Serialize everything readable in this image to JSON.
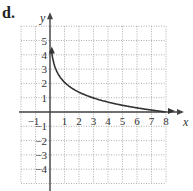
{
  "figure_label": "d.",
  "chart_data": {
    "type": "line",
    "title": "",
    "xlabel": "x",
    "ylabel": "y",
    "xlim": [
      -2,
      8
    ],
    "ylim": [
      -5,
      6
    ],
    "grid": true,
    "grid_style": "dotted",
    "x_ticks": [
      -1,
      1,
      2,
      3,
      4,
      5,
      6,
      7,
      8
    ],
    "y_ticks": [
      5,
      4,
      3,
      2,
      1,
      -1,
      -2,
      -3,
      -4
    ],
    "series": [
      {
        "name": "curve",
        "description": "decreasing logarithmic curve, approx y = ln(8/x), with arrow pointing upward near the y-axis",
        "x": [
          0.125,
          0.25,
          0.5,
          1,
          2,
          3,
          4,
          5,
          6,
          7,
          8
        ],
        "y": [
          4.16,
          3.47,
          2.77,
          2.08,
          1.39,
          0.98,
          0.69,
          0.47,
          0.29,
          0.13,
          0.0
        ]
      }
    ]
  },
  "colors": {
    "curve": "#333333",
    "axis": "#444444",
    "grid": "#9a9a9a"
  }
}
